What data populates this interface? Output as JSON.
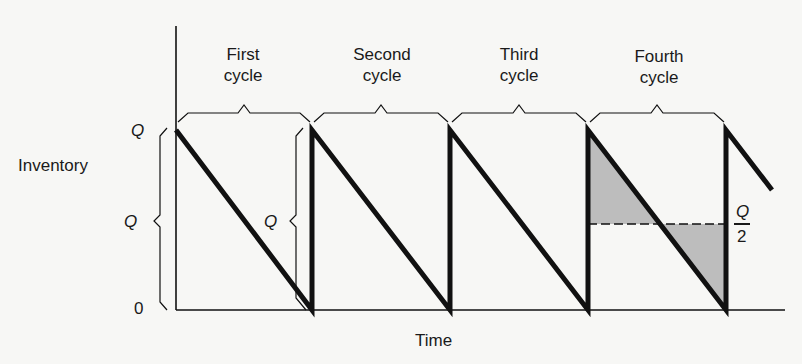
{
  "figure": {
    "type": "sawtooth inventory diagram",
    "y_axis_label": "Inventory",
    "x_axis_label": "Time",
    "y_ticks": [
      {
        "label": "Q",
        "value": "Q",
        "italic": true
      },
      {
        "label": "0",
        "value": 0,
        "italic": false
      }
    ],
    "brace_labels": {
      "left_brace": "Q",
      "inner_brace": "Q"
    },
    "half_level_label": {
      "numerator": "Q",
      "denominator": "2"
    },
    "cycles": [
      {
        "label_line1": "First",
        "label_line2": "cycle"
      },
      {
        "label_line1": "Second",
        "label_line2": "cycle"
      },
      {
        "label_line1": "Third",
        "label_line2": "cycle"
      },
      {
        "label_line1": "Fourth",
        "label_line2": "cycle"
      }
    ],
    "shaded_cycle_index": 4,
    "colors": {
      "line": "#111111",
      "shade": "#bdbdbd",
      "background": "#f7f7f5"
    }
  },
  "geometry": {
    "axis_x": 176,
    "axis_top": 26,
    "baseline_y": 310,
    "axis_right": 785,
    "peak_y": 130,
    "half_y": 224,
    "cycle_x": [
      176,
      312,
      450,
      588,
      726
    ],
    "tail_end": [
      772,
      190
    ],
    "brace_y": 113
  }
}
